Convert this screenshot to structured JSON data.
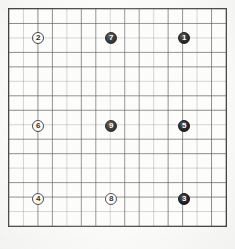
{
  "diagram": {
    "kind": "go-board-diagram",
    "title": "",
    "caption": ""
  },
  "board": {
    "columns": 15,
    "rows": 15,
    "line_count_horizontal": 16,
    "line_count_vertical": 16,
    "cell_size_px": 14.6,
    "origin_x_px": 8,
    "origin_y_px": 8,
    "width_px": 219,
    "height_px": 219,
    "line_color": "#4d4d4d",
    "border_color": "#3a3a3a",
    "background_color": "#fdfdfc",
    "star_points": []
  },
  "stones": [
    {
      "label": "1",
      "color": "black",
      "col": 12,
      "row": 2
    },
    {
      "label": "2",
      "color": "white",
      "col": 2,
      "row": 2
    },
    {
      "label": "3",
      "color": "black",
      "col": 12,
      "row": 13
    },
    {
      "label": "4",
      "color": "white",
      "col": 2,
      "row": 13
    },
    {
      "label": "5",
      "color": "black",
      "col": 12,
      "row": 8
    },
    {
      "label": "6",
      "color": "white",
      "col": 2,
      "row": 8
    },
    {
      "label": "7",
      "color": "black",
      "col": 7,
      "row": 2
    },
    {
      "label": "8",
      "color": "white",
      "col": 7,
      "row": 13
    },
    {
      "label": "9",
      "color": "black",
      "col": 7,
      "row": 8
    }
  ],
  "colors": {
    "black_stone": "#000000",
    "white_stone": "#ffffff",
    "black_stone_text": "#ffffff",
    "white_stone_text": "#111111",
    "grid_line": "#4d4d4d",
    "page_background": "#fbfbfa"
  }
}
